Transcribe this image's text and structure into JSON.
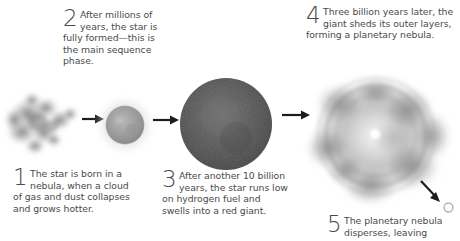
{
  "figure": {
    "background_color": "#ffffff",
    "text_color": "#4a4a4a"
  },
  "steps": [
    {
      "number": "1",
      "text": "The star is born in a nebula, when a cloud of gas and dust collapses and grows hotter.",
      "name": "caption-step-1"
    },
    {
      "number": "2",
      "text": "After millions of years, the star is fully formed—this is the main sequence phase.",
      "name": "caption-step-2"
    },
    {
      "number": "3",
      "text": "After another 10 billion years, the star runs low on hydrogen fuel and swells into a red giant.",
      "name": "caption-step-3"
    },
    {
      "number": "4",
      "text": "Three billion years later, the giant sheds its outer layers, forming a planetary nebula.",
      "name": "caption-step-4"
    },
    {
      "number": "5",
      "text": "The planetary nebula disperses, leaving",
      "name": "caption-step-5"
    }
  ],
  "artwork": {
    "nebula": {
      "label": "nebula-cloud",
      "color": "#8a8a8a"
    },
    "main_sequence_star": {
      "label": "main-sequence-star",
      "color": "#9a9a9a",
      "halo_color": "#d9d9d9"
    },
    "red_giant": {
      "label": "red-giant-star",
      "color": "#575757"
    },
    "planetary_nebula": {
      "label": "planetary-nebula",
      "color": "#9d9d9d",
      "core_color": "#ffffff"
    },
    "white_dwarf": {
      "label": "white-dwarf",
      "color": "#b4b4b4"
    }
  },
  "arrows": [
    {
      "name": "arrow-nebula-to-star",
      "direction": "right"
    },
    {
      "name": "arrow-star-to-red-giant",
      "direction": "right"
    },
    {
      "name": "arrow-red-giant-to-planetary-nebula",
      "direction": "right"
    },
    {
      "name": "arrow-nebula-to-white-dwarf",
      "direction": "down-right"
    }
  ]
}
